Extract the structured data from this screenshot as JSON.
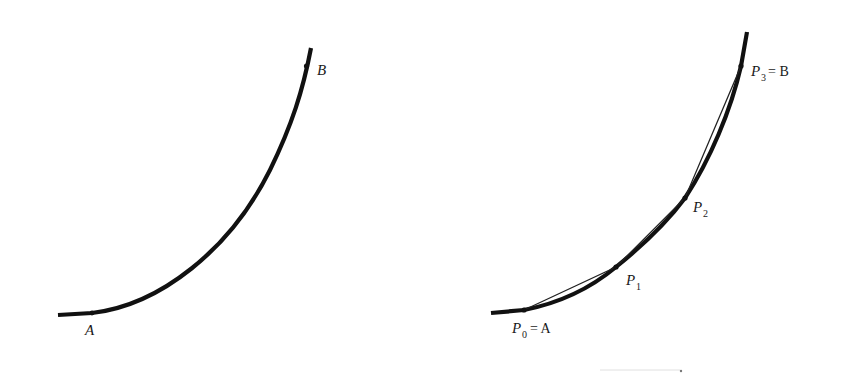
{
  "figure": {
    "left_panel": {
      "labels": {
        "start": "A",
        "end": "B"
      }
    },
    "right_panel": {
      "labels": {
        "p0_base": "P",
        "p0_sub": "0",
        "p0_eq": "= A",
        "p1_base": "P",
        "p1_sub": "1",
        "p2_base": "P",
        "p2_sub": "2",
        "p3_base": "P",
        "p3_sub": "3",
        "p3_eq": "= B"
      }
    },
    "colors": {
      "curve": "#111111",
      "chord": "#222222",
      "background": "#ffffff"
    }
  }
}
